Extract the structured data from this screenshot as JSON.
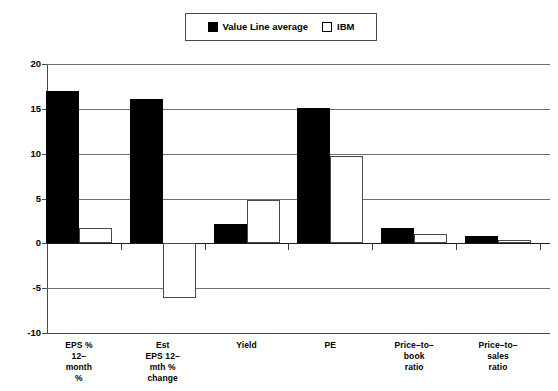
{
  "legend": {
    "entries": [
      {
        "label": "Value Line average",
        "style": "filled",
        "color": "#000000",
        "icon": "filled-square-icon"
      },
      {
        "label": "IBM",
        "style": "open",
        "color": "#ffffff",
        "icon": "open-square-icon"
      }
    ]
  },
  "axis": {
    "yticks": [
      "20",
      "15",
      "10",
      "5",
      "0",
      "-5",
      "-10"
    ]
  },
  "categories_display": [
    [
      "EPS %",
      "12–",
      "month",
      "%"
    ],
    [
      "Est",
      "EPS 12–",
      "mth %",
      "change"
    ],
    [
      "Yield"
    ],
    [
      "PE"
    ],
    [
      "Price–to–",
      "book",
      "ratio"
    ],
    [
      "Price–to–",
      "sales",
      "ratio"
    ]
  ],
  "chart_data": {
    "type": "bar",
    "title": "",
    "xlabel": "",
    "ylabel": "",
    "ylim": [
      -10,
      20
    ],
    "yticks": [
      20,
      15,
      10,
      5,
      0,
      -5,
      -10
    ],
    "grid": true,
    "legend_position": "top-center",
    "categories": [
      "EPS % 12-month %",
      "Est EPS 12-mth % change",
      "Yield",
      "PE",
      "Price-to-book ratio",
      "Price-to-sales ratio"
    ],
    "series": [
      {
        "name": "Value Line average",
        "color": "#000000",
        "values": [
          17.0,
          16.1,
          2.2,
          15.1,
          1.7,
          0.8
        ]
      },
      {
        "name": "IBM",
        "color": "#ffffff",
        "values": [
          1.7,
          -6.1,
          4.8,
          9.7,
          1.0,
          0.4
        ]
      }
    ]
  }
}
